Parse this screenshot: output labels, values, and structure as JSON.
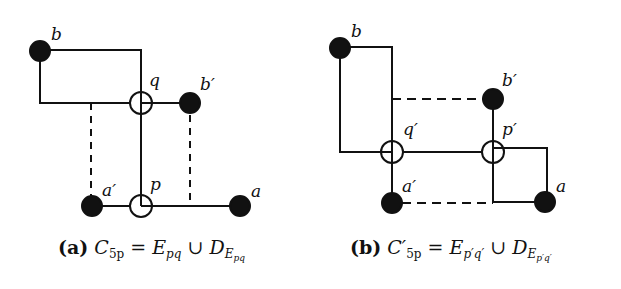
{
  "figure": {
    "panels": [
      {
        "id": "a",
        "labels": {
          "b": "b",
          "q": "q",
          "b_prime": "b′",
          "a_prime": "a′",
          "p": "p",
          "a": "a"
        },
        "caption": {
          "tag": "(a)",
          "lhs": "C",
          "lhs_sub": "5p",
          "eq": " = ",
          "e": "E",
          "e_sub": "pq",
          "union": " ∪ ",
          "d": "D",
          "d_sub": "E",
          "d_sub_sub": "pq"
        }
      },
      {
        "id": "b",
        "labels": {
          "b": "b",
          "q_prime": "q′",
          "b_prime": "b′",
          "p_prime": "p′",
          "a_prime": "a′",
          "a": "a"
        },
        "caption": {
          "tag": "(b)",
          "lhs": "C′",
          "lhs_sub": "5p",
          "eq": " = ",
          "e": "E",
          "e_sub": "p′q′",
          "union": " ∪ ",
          "d": "D",
          "d_sub": "E",
          "d_sub_sub": "p′q′"
        }
      }
    ],
    "colors": {
      "ink": "#111111",
      "background": "#ffffff"
    }
  }
}
